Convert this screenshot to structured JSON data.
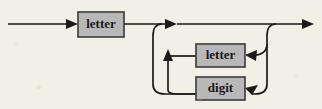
{
  "diagram": {
    "kind": "railroad-syntax-diagram",
    "background_color": "#f2efe6",
    "box_fill_color": "#b8b8b8",
    "box_border_color": "#3a3a3a",
    "line_color": "#1a1a1a",
    "text_color": "#1a1a1a",
    "boxes": [
      {
        "id": "first-letter",
        "label": "letter",
        "x": 78,
        "y": 12,
        "width": 46,
        "height": 25,
        "role": "required-first-terminal"
      },
      {
        "id": "loop-letter",
        "label": "letter",
        "x": 196,
        "y": 44,
        "width": 49,
        "height": 23,
        "role": "repeatable-alternative"
      },
      {
        "id": "loop-digit",
        "label": "digit",
        "x": 196,
        "y": 77,
        "width": 49,
        "height": 23,
        "role": "repeatable-alternative"
      }
    ],
    "arrows": [
      {
        "id": "entry-arrow",
        "x": 78,
        "y": 24,
        "direction": "right"
      },
      {
        "id": "main-split-arrow",
        "x": 176,
        "y": 24,
        "direction": "right"
      },
      {
        "id": "loop-return-arrow",
        "x": 168,
        "y": 50,
        "direction": "up"
      },
      {
        "id": "letter-feed-arrow",
        "x": 245,
        "y": 55,
        "direction": "left"
      },
      {
        "id": "digit-feed-arrow",
        "x": 245,
        "y": 88,
        "direction": "left"
      },
      {
        "id": "exit-arrow",
        "x": 313,
        "y": 24,
        "direction": "right"
      }
    ],
    "paths": [
      {
        "id": "entry-line",
        "description": "horizontal input line into first letter box"
      },
      {
        "id": "bypass-line",
        "description": "straight-through line skipping the loop"
      },
      {
        "id": "exit-line",
        "description": "horizontal output line to the right edge"
      },
      {
        "id": "loop-down-left",
        "description": "left descending branch feeding the alternatives"
      },
      {
        "id": "loop-up-right",
        "description": "right ascending branch returning to the main line"
      },
      {
        "id": "letter-in",
        "description": "connector into loop letter box"
      },
      {
        "id": "digit-in",
        "description": "connector into loop digit box"
      }
    ]
  }
}
